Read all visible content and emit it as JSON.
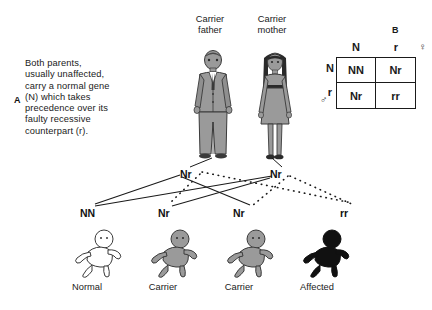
{
  "panel_a": {
    "letter": "A",
    "text_lines": [
      "Both parents,",
      "usually unaffected,",
      "carry a normal gene",
      "(N) which takes",
      "precedence over its",
      "faulty recessive",
      "counterpart (r)."
    ],
    "text_full": "Both parents, usually unaffected, carry a normal gene (N) which takes precedence over its faulty recessive counterpart (r)."
  },
  "panel_b": {
    "letter": "B",
    "column_headers": [
      "N",
      "r"
    ],
    "row_headers": [
      "N",
      "r"
    ],
    "female_symbol": "♀",
    "male_symbol": "♂",
    "cells": [
      [
        "NN",
        "Nr"
      ],
      [
        "Nr",
        "rr"
      ]
    ]
  },
  "parents": [
    {
      "caption_line1": "Carrier",
      "caption_line2": "father",
      "genotype": "Nr",
      "icon": "adult-male-figure"
    },
    {
      "caption_line1": "Carrier",
      "caption_line2": "mother",
      "genotype": "Nr",
      "icon": "adult-female-figure"
    }
  ],
  "offspring": [
    {
      "genotype": "NN",
      "label": "Normal",
      "icon": "baby-figure-white",
      "fill": "#ffffff"
    },
    {
      "genotype": "Nr",
      "label": "Carrier",
      "icon": "baby-figure-grey",
      "fill": "#9a9a9a"
    },
    {
      "genotype": "Nr",
      "label": "Carrier",
      "icon": "baby-figure-grey",
      "fill": "#9a9a9a"
    },
    {
      "genotype": "rr",
      "label": "Affected",
      "icon": "baby-figure-black",
      "fill": "#111111"
    }
  ],
  "colors": {
    "ink": "#1a1a1a",
    "figure_grey": "#9a9a9a",
    "figure_dark": "#5e5e5e",
    "affected_black": "#111111",
    "background": "#ffffff"
  },
  "legend": {
    "solid_line_meaning": "normal allele N inherited",
    "dotted_line_meaning": "faulty recessive allele r inherited"
  }
}
